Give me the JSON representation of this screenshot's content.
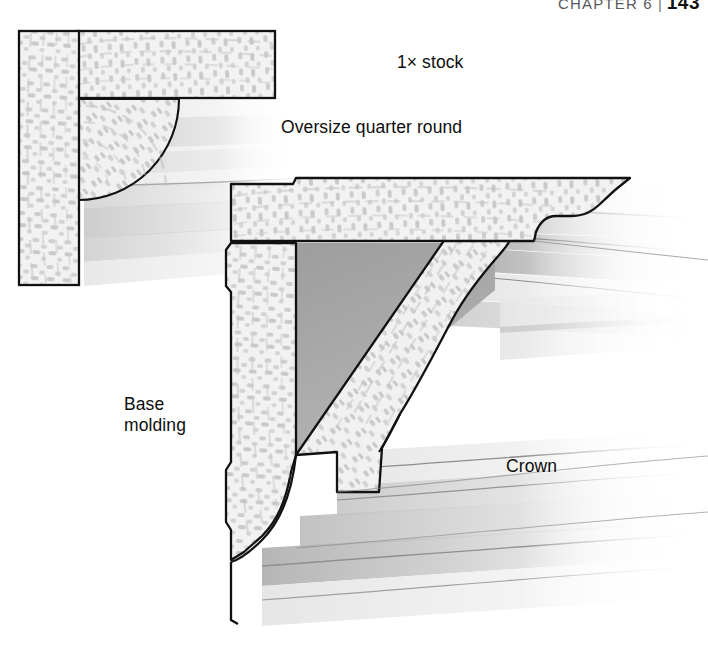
{
  "running_head": {
    "chapter_label": "CHAPTER 6",
    "separator": "|",
    "page_number": "143"
  },
  "figure": {
    "labels": {
      "stock": "1× stock",
      "quarter_round": "Oversize quarter round",
      "base_molding": "Base\nmolding",
      "crown": "Crown"
    },
    "colors": {
      "page_background": "#ffffff",
      "outline": "#000000",
      "wood_light": "#f0f0f0",
      "wood_grain": "#c6c6c6",
      "void_gray": "#a8a8a8",
      "profile_light": "#e8e8e8",
      "profile_mid": "#cfcfcf",
      "profile_dark": "#b4b4b4",
      "label_text": "#0d0d0d"
    },
    "parts": [
      {
        "id": "detail-vertical-board",
        "name": "1× stock vertical board",
        "view": "upper-left detail"
      },
      {
        "id": "detail-horizontal-board",
        "name": "1× stock horizontal board",
        "view": "upper-left detail"
      },
      {
        "id": "detail-quarter-round",
        "name": "Oversize quarter round",
        "view": "upper-left detail"
      },
      {
        "id": "main-top-board",
        "name": "1× stock top board with ogee edge",
        "view": "main section"
      },
      {
        "id": "main-wall-board",
        "name": "Base molding vertical board",
        "view": "main section"
      },
      {
        "id": "main-crown",
        "name": "Crown molding run diagonally",
        "view": "main section"
      },
      {
        "id": "main-void",
        "name": "Triangular cavity behind crown",
        "view": "main section"
      }
    ]
  }
}
